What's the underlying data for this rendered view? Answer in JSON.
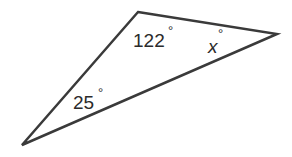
{
  "diagram": {
    "type": "triangle",
    "vertices": {
      "top": [
        138,
        12
      ],
      "right": [
        277,
        34
      ],
      "bottom_left": [
        22,
        145
      ]
    },
    "stroke_color": "#3a3a3a",
    "angles": {
      "top": {
        "value": "122",
        "degree": "°"
      },
      "right": {
        "value": "x",
        "degree": "°"
      },
      "bottom_left": {
        "value": "25",
        "degree": "°"
      }
    }
  }
}
